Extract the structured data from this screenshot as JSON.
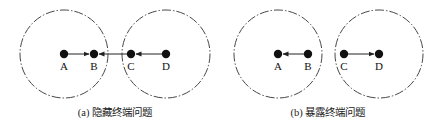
{
  "panels": [
    {
      "id": "a",
      "caption": "(a) 隐藏终端问题",
      "circles": [
        {
          "cx": 64,
          "cy": 54,
          "r": 44
        },
        {
          "cx": 166,
          "cy": 54,
          "r": 44
        }
      ],
      "nodes": [
        {
          "label": "A",
          "x": 64,
          "y": 54
        },
        {
          "label": "B",
          "x": 94,
          "y": 54
        },
        {
          "label": "C",
          "x": 131,
          "y": 54
        },
        {
          "label": "D",
          "x": 166,
          "y": 54
        }
      ],
      "arrows": [
        {
          "from": "A",
          "to": "B"
        },
        {
          "from": "C",
          "to": "B"
        },
        {
          "from": "D",
          "to": "C"
        }
      ]
    },
    {
      "id": "b",
      "caption": "(b) 暴露终端问题",
      "circles": [
        {
          "cx": 278,
          "cy": 54,
          "r": 44
        },
        {
          "cx": 379,
          "cy": 54,
          "r": 44
        }
      ],
      "nodes": [
        {
          "label": "A",
          "x": 278,
          "y": 54
        },
        {
          "label": "B",
          "x": 308,
          "y": 54
        },
        {
          "label": "C",
          "x": 344,
          "y": 54
        },
        {
          "label": "D",
          "x": 379,
          "y": 54
        }
      ],
      "arrows": [
        {
          "from": "B",
          "to": "A"
        },
        {
          "from": "C",
          "to": "D"
        }
      ]
    }
  ],
  "colors": {
    "stroke": "#222222",
    "node": "#111111",
    "circle": "#333333"
  }
}
